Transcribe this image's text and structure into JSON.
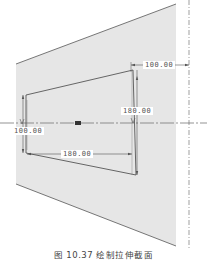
{
  "figure": {
    "caption": "图 10.37  绘制拉伸截面"
  },
  "dimensions": {
    "top_offset": "100.00",
    "right_height": "180.00",
    "left_height": "100.00",
    "bottom_width": "180.00"
  },
  "colors": {
    "plane_fill": "#e6e6e6",
    "edge": "#555555",
    "axis": "#666666",
    "background": "#ffffff"
  }
}
